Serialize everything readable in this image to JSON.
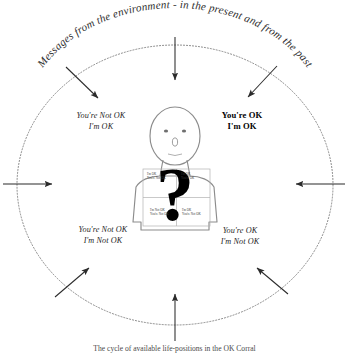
{
  "diagram": {
    "header_text": "Messages from the environment - in the present and from the past",
    "caption": "The cycle of available life-positions in the OK Corral",
    "center_symbol": "?",
    "colors": {
      "circle_stroke": "#7a7a7a",
      "arrow": "#2b2b2b",
      "figure_stroke": "#8c8c8c",
      "question_mark": "#000000",
      "text": "#1f1f1f",
      "background": "#ffffff"
    },
    "quadrant_labels": [
      {
        "id": "top-left",
        "line1": "You're Not OK",
        "line2": "I'm OK",
        "emphasis": "italic"
      },
      {
        "id": "top-right",
        "line1": "You're OK",
        "line2": "I'm OK",
        "emphasis": "bold"
      },
      {
        "id": "bottom-left",
        "line1": "You're Not OK",
        "line2": "I'm Not OK",
        "emphasis": "italic"
      },
      {
        "id": "bottom-right",
        "line1": "You're OK",
        "line2": "I'm Not OK",
        "emphasis": "italic"
      }
    ],
    "inner_grid_labels": [
      {
        "id": "inner-top-left",
        "line1": "I'm OK",
        "line2": "You're Not OK"
      },
      {
        "id": "inner-top-right",
        "line1": "I'm OK",
        "line2": "You're OK"
      },
      {
        "id": "inner-bottom-left",
        "line1": "I'm Not OK",
        "line2": "You're Not OK"
      },
      {
        "id": "inner-bottom-right",
        "line1": "I'm OK",
        "line2": "You're Not OK"
      }
    ],
    "arrows": [
      {
        "id": "arrow-n",
        "direction": "down"
      },
      {
        "id": "arrow-ne",
        "direction": "down-left"
      },
      {
        "id": "arrow-e",
        "direction": "left"
      },
      {
        "id": "arrow-se",
        "direction": "up-left"
      },
      {
        "id": "arrow-s",
        "direction": "up"
      },
      {
        "id": "arrow-sw",
        "direction": "up-right"
      },
      {
        "id": "arrow-w",
        "direction": "right"
      },
      {
        "id": "arrow-nw",
        "direction": "down-right"
      }
    ]
  }
}
